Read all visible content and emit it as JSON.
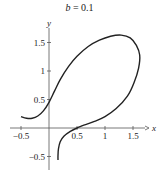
{
  "title": {
    "var": "b",
    "text": " = 0.1"
  },
  "chart_data": {
    "type": "line",
    "title": "b = 0.1",
    "xlabel": "x",
    "ylabel": "y",
    "xlim": [
      -0.55,
      1.75
    ],
    "ylim": [
      -0.65,
      1.75
    ],
    "grid": false,
    "legend": null,
    "x_ticks": [
      -0.5,
      0.5,
      1,
      1.5
    ],
    "x_tick_labels": [
      "−0.5",
      "0.5",
      "1",
      "1.5"
    ],
    "y_ticks": [
      -0.5,
      0.5,
      1,
      1.5
    ],
    "y_tick_labels": [
      "−0.5",
      "0.5",
      "1",
      "1.5"
    ],
    "series": [
      {
        "name": "curve",
        "color": "#222222",
        "points": [
          [
            -0.5,
            0.2
          ],
          [
            -0.4,
            0.17
          ],
          [
            -0.3,
            0.17
          ],
          [
            -0.2,
            0.21
          ],
          [
            -0.1,
            0.3
          ],
          [
            0.0,
            0.45
          ],
          [
            0.1,
            0.65
          ],
          [
            0.2,
            0.85
          ],
          [
            0.35,
            1.08
          ],
          [
            0.5,
            1.26
          ],
          [
            0.7,
            1.43
          ],
          [
            0.9,
            1.54
          ],
          [
            1.1,
            1.61
          ],
          [
            1.29,
            1.63
          ],
          [
            1.45,
            1.58
          ],
          [
            1.56,
            1.45
          ],
          [
            1.62,
            1.28
          ],
          [
            1.6,
            1.05
          ],
          [
            1.52,
            0.8
          ],
          [
            1.4,
            0.56
          ],
          [
            1.2,
            0.34
          ],
          [
            1.0,
            0.2
          ],
          [
            0.8,
            0.11
          ],
          [
            0.6,
            0.04
          ],
          [
            0.5,
            0.0
          ],
          [
            0.38,
            -0.06
          ],
          [
            0.27,
            -0.14
          ],
          [
            0.2,
            -0.24
          ],
          [
            0.17,
            -0.36
          ],
          [
            0.16,
            -0.48
          ],
          [
            0.16,
            -0.56
          ]
        ]
      }
    ]
  }
}
